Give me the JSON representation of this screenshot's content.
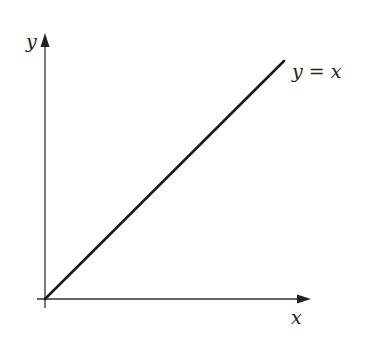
{
  "diagram": {
    "type": "function-graph",
    "axes": {
      "x_label": "x",
      "y_label": "y",
      "origin": [
        45,
        299
      ],
      "x_axis_end": 310,
      "y_axis_end": 33
    },
    "line": {
      "label": "y = x",
      "from": [
        45,
        299
      ],
      "to": [
        284,
        61
      ]
    },
    "colors": {
      "axis": "#333333",
      "line": "#1a1a1a",
      "text": "#222222",
      "background": "#ffffff"
    }
  }
}
